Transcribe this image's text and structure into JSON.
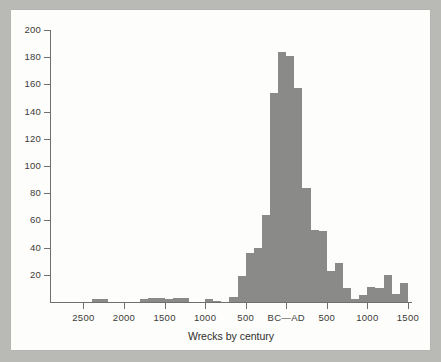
{
  "figure": {
    "background_color": "#b9b9b6",
    "card_color": "#fdfdfb",
    "bar_color": "#8a8a88",
    "axis_color": "#6f6f6d"
  },
  "chart_data": {
    "type": "bar",
    "title": "",
    "subtitle": "",
    "xlabel": "Wrecks by century",
    "ylabel": "",
    "grid": false,
    "legend": null,
    "ylim": [
      0,
      200
    ],
    "ytick_labels": [
      "20",
      "40",
      "60",
      "80",
      "100",
      "120",
      "140",
      "160",
      "180",
      "200"
    ],
    "ytick_values": [
      20,
      40,
      60,
      80,
      100,
      120,
      140,
      160,
      180,
      200
    ],
    "xtick_labels": [
      "2500",
      "2000",
      "1500",
      "1000",
      "500",
      "BC—AD",
      "500",
      "1000",
      "1500"
    ],
    "xtick_values": [
      -2500,
      -2000,
      -1500,
      -1000,
      -500,
      0,
      500,
      1000,
      1500
    ],
    "xlim": [
      -2900,
      1550
    ],
    "bin_width_years": 100,
    "categories": [
      "2900-2800 BC",
      "2800-2700 BC",
      "2700-2600 BC",
      "2600-2500 BC",
      "2500-2400 BC",
      "2400-2300 BC",
      "2300-2200 BC",
      "2200-2100 BC",
      "2100-2000 BC",
      "2000-1900 BC",
      "1900-1800 BC",
      "1800-1700 BC",
      "1700-1600 BC",
      "1600-1500 BC",
      "1500-1400 BC",
      "1400-1300 BC",
      "1300-1200 BC",
      "1200-1100 BC",
      "1100-1000 BC",
      "1000-900 BC",
      "900-800 BC",
      "800-700 BC",
      "700-600 BC",
      "600-500 BC",
      "500-400 BC",
      "400-300 BC",
      "300-200 BC",
      "200-100 BC",
      "100-1 BC",
      "AD 1-100",
      "AD 100-200",
      "AD 200-300",
      "AD 300-400",
      "AD 400-500",
      "AD 500-600",
      "AD 600-700",
      "AD 700-800",
      "AD 800-900",
      "AD 900-1000",
      "AD 1000-1100",
      "AD 1100-1200",
      "AD 1200-1300",
      "AD 1300-1400",
      "AD 1400-1500"
    ],
    "values": [
      0,
      0,
      0,
      0,
      0,
      2,
      2,
      0,
      0,
      0,
      0,
      2,
      3,
      3,
      2,
      3,
      3,
      0,
      0,
      2,
      1,
      0,
      4,
      19,
      36,
      40,
      64,
      154,
      184,
      181,
      157,
      84,
      53,
      52,
      23,
      29,
      10,
      2,
      5,
      11,
      10,
      20,
      6,
      14
    ]
  }
}
